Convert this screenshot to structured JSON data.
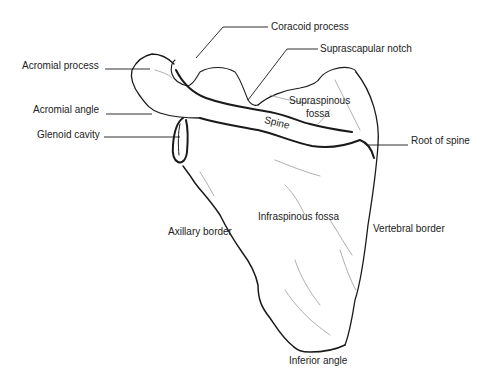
{
  "diagram": {
    "colors": {
      "ink": "#1a1a1a",
      "text": "#222222",
      "background": "#ffffff",
      "shading": "#9a9a9a"
    },
    "labels": {
      "coracoid_process": "Coracoid process",
      "suprascapular_notch": "Suprascapular notch",
      "acromial_process": "Acromial process",
      "acromial_angle": "Acromial angle",
      "glenoid_cavity": "Glenoid cavity",
      "supraspinous_fossa_1": "Supraspinous",
      "supraspinous_fossa_2": "fossa",
      "spine": "Spine",
      "root_of_spine": "Root of spine",
      "infraspinous_fossa": "Infraspinous fossa",
      "axillary_border": "Axillary border",
      "vertebral_border": "Vertebral border",
      "inferior_angle": "Inferior angle"
    }
  }
}
